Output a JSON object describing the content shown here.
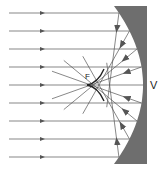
{
  "diagram": {
    "type": "concave-mirror-spherical-aberration",
    "labels": {
      "vertex": "V",
      "focus": "F"
    },
    "colors": {
      "mirror": "#6e6e6e",
      "ray": "#555555",
      "caustic": "#222222",
      "background": "#ffffff"
    },
    "incident_ray_y": [
      13,
      31,
      49,
      67,
      85,
      103,
      121,
      139,
      157
    ],
    "ray_start_x": 9,
    "arrow_x": 43,
    "mirror": {
      "left_top_x": 114,
      "left_mid_x": 143,
      "right_x": 147,
      "top_y": 6,
      "bottom_y": 164
    },
    "focus_point": {
      "x": 90,
      "y": 85
    }
  }
}
